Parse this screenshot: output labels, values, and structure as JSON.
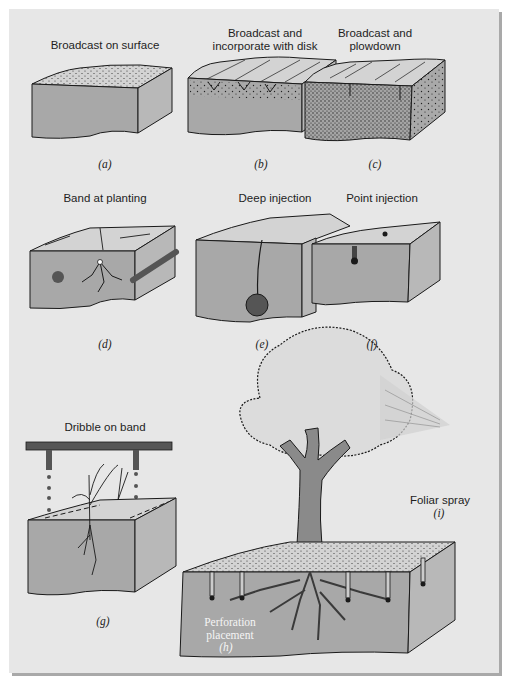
{
  "figure": {
    "colors": {
      "background": "#e7e7e7",
      "soil": "#a8a8a8",
      "soil_side": "#b9b9b9",
      "surface": "#d6d6d6",
      "ink": "#1a1a1a",
      "shadow": "#a9a9a9"
    },
    "panels": [
      {
        "id": "a",
        "caption": "Broadcast on surface",
        "tag": "(a)"
      },
      {
        "id": "b",
        "caption": "Broadcast and incorporate with disk",
        "caption_lines": [
          "Broadcast and",
          "incorporate with disk"
        ],
        "tag": "(b)"
      },
      {
        "id": "c",
        "caption": "Broadcast and plowdown",
        "caption_lines": [
          "Broadcast and",
          "plowdown"
        ],
        "tag": "(c)"
      },
      {
        "id": "d",
        "caption": "Band at planting",
        "tag": "(d)"
      },
      {
        "id": "e",
        "caption": "Deep injection",
        "tag": "(e)"
      },
      {
        "id": "f",
        "caption": "Point injection",
        "tag": "(f)"
      },
      {
        "id": "g",
        "caption": "Dribble on band",
        "tag": "(g)"
      },
      {
        "id": "h",
        "caption": "Perforation placement",
        "caption_lines": [
          "Perforation",
          "placement"
        ],
        "tag": "(h)"
      },
      {
        "id": "i",
        "caption": "Foliar spray",
        "tag": "(i)"
      }
    ]
  }
}
